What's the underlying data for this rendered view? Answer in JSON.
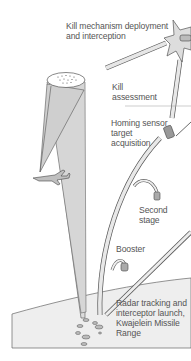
{
  "diagram": {
    "type": "missile-intercept-sequence",
    "colors": {
      "background": "#ffffff",
      "line": "#555555",
      "fill": "#dddddd",
      "beam_fill": "#d6d6d6",
      "ground_fill": "#eeeeee",
      "text": "#555555"
    },
    "labels": {
      "kill_mechanism": "Kill mechanism deployment\nand interception",
      "kill_assessment": "Kill\nassessment",
      "homing_sensor": "Homing sensor\ntarget\nacquisition",
      "second_stage": "Second\nstage",
      "booster": "Booster",
      "radar_launch": "Radar tracking and\ninterceptor launch,\nKwajelein Missile\nRange"
    },
    "elements": [
      {
        "name": "sensor-beam",
        "kind": "cone",
        "shape": "cylinder with dotted top (target cloud)"
      },
      {
        "name": "tracking-beam",
        "kind": "cone",
        "shape": "narrow beam to aircraft"
      },
      {
        "name": "aircraft",
        "kind": "icon",
        "shape": "airplane"
      },
      {
        "name": "interceptor-trajectory",
        "kind": "path",
        "shape": "curved rising tube"
      },
      {
        "name": "target-trajectory",
        "kind": "path",
        "shape": "incoming diagonal tube"
      },
      {
        "name": "interception-burst",
        "kind": "icon",
        "shape": "star burst"
      },
      {
        "name": "second-stage-drop",
        "kind": "icon",
        "shape": "falling canister"
      },
      {
        "name": "booster-drop",
        "kind": "icon",
        "shape": "falling canister"
      },
      {
        "name": "homing-vehicle",
        "kind": "icon",
        "shape": "cylinder with antenna"
      },
      {
        "name": "ground-island",
        "kind": "region",
        "shape": "sloped ground with radar stations"
      }
    ]
  }
}
